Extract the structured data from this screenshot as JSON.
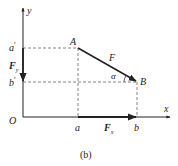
{
  "diagram": {
    "caption": "(b)",
    "axes": {
      "x_label": "x",
      "y_label": "y",
      "origin_label": "O"
    },
    "points": {
      "A": "A",
      "B": "B"
    },
    "projections": {
      "a": "a",
      "b": "b",
      "a_prime": "a",
      "b_prime": "b",
      "prime": "′"
    },
    "vectors": {
      "force": "F",
      "force_x": "F",
      "force_x_sub": "x",
      "force_y": "F",
      "force_y_sub": "y"
    },
    "angle_label": "α",
    "colors": {
      "line": "#222222",
      "dashed": "#666666",
      "background": "#ffffff"
    }
  }
}
